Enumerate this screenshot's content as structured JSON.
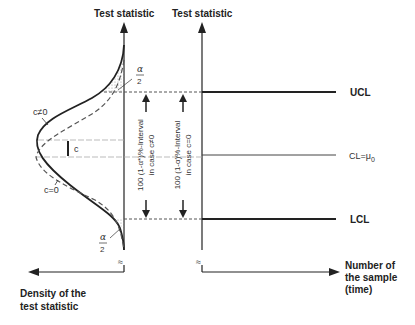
{
  "diagram": {
    "left_axis_title": "Test statistic",
    "right_axis_title": "Test statistic",
    "left_x_axis_label_line1": "Density of the",
    "left_x_axis_label_line2": "test statistic",
    "right_x_axis_label_line1": "Number of",
    "right_x_axis_label_line2": "the sample",
    "right_x_axis_label_line3": "(time)",
    "ucl_label": "UCL",
    "lcl_label": "LCL",
    "cl_label": "CL=μ",
    "cl_subscript": "0",
    "curve_shifted_label": "c≠0",
    "curve_nominal_label": "c=0",
    "shift_label": "c",
    "alpha_top_num": "α",
    "alpha_top_den": "2",
    "alpha_bottom_num": "α",
    "alpha_bottom_den": "2",
    "interval_shifted_line1": "100 (1-α*)%-Interval",
    "interval_shifted_line2": "in case c≠0",
    "interval_nominal_line1": "100 (1-α)%-Interval",
    "interval_nominal_line2": "in case c=0",
    "axis_break_symbol": "≈"
  },
  "colors": {
    "ink": "#222222",
    "dashed": "#555555",
    "guide": "#999999",
    "shade": "#bbbbbb"
  }
}
